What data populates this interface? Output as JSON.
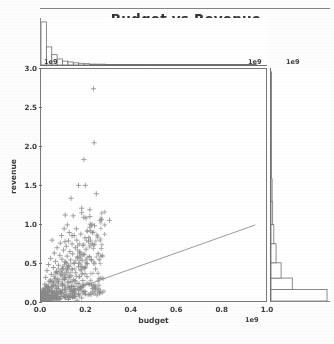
{
  "figure": {
    "title": "Budget vs Revenue",
    "background_color": "#ffffff",
    "marker_color": "#8a8a8a",
    "line_color": "#9a9a9a",
    "axis_color": "#6f6f6f"
  },
  "axes": {
    "xlabel": "budget",
    "ylabel": "revenue",
    "x_offset_text": "1e9",
    "y_offset_text": "1e9",
    "top_marginal_offset_text": "1e9",
    "right_marginal_offset_text": "1e9",
    "xticks": [
      "0.0",
      "0.2",
      "0.4",
      "0.6",
      "0.8",
      "1.0"
    ],
    "yticks": [
      "0.0",
      "0.5",
      "1.0",
      "1.5",
      "2.0",
      "2.5",
      "3.0"
    ]
  },
  "chart_data": {
    "type": "scatter",
    "title": "Budget vs Revenue",
    "xlabel": "budget",
    "ylabel": "revenue",
    "xlim": [
      0,
      1.05
    ],
    "ylim": [
      0,
      3.05
    ],
    "x_scale_offset": "1e9",
    "y_scale_offset": "1e9",
    "grid": false,
    "legend": null,
    "marker": "+",
    "marker_color": "#8a8a8a",
    "reference_line": {
      "label": "y = x",
      "color": "#9a9a9a",
      "x": [
        0.0,
        1.0
      ],
      "y": [
        0.0,
        1.0
      ]
    },
    "points": [
      [
        0.245,
        2.79
      ],
      [
        0.248,
        2.08
      ],
      [
        0.2,
        1.86
      ],
      [
        0.175,
        1.52
      ],
      [
        0.207,
        1.52
      ],
      [
        0.258,
        1.41
      ],
      [
        0.14,
        1.35
      ],
      [
        0.19,
        1.22
      ],
      [
        0.228,
        1.2
      ],
      [
        0.19,
        1.16
      ],
      [
        0.228,
        1.11
      ],
      [
        0.2,
        1.1
      ],
      [
        0.21,
        1.09
      ],
      [
        0.113,
        1.13
      ],
      [
        0.15,
        1.12
      ],
      [
        0.32,
        1.06
      ],
      [
        0.25,
        0.99
      ],
      [
        0.228,
        0.97
      ],
      [
        0.123,
        1.0
      ],
      [
        0.108,
        0.95
      ],
      [
        0.165,
        0.95
      ],
      [
        0.232,
        0.92
      ],
      [
        0.24,
        0.9
      ],
      [
        0.186,
        0.88
      ],
      [
        0.145,
        0.86
      ],
      [
        0.096,
        0.86
      ],
      [
        0.052,
        0.8
      ],
      [
        0.205,
        0.83
      ],
      [
        0.167,
        0.8
      ],
      [
        0.128,
        0.79
      ],
      [
        0.222,
        0.78
      ],
      [
        0.09,
        0.76
      ],
      [
        0.145,
        0.75
      ],
      [
        0.196,
        0.73
      ],
      [
        0.118,
        0.72
      ],
      [
        0.075,
        0.7
      ],
      [
        0.16,
        0.7
      ],
      [
        0.21,
        0.68
      ],
      [
        0.105,
        0.67
      ],
      [
        0.135,
        0.65
      ],
      [
        0.182,
        0.64
      ],
      [
        0.062,
        0.63
      ],
      [
        0.148,
        0.62
      ],
      [
        0.2,
        0.61
      ],
      [
        0.088,
        0.6
      ],
      [
        0.122,
        0.59
      ],
      [
        0.17,
        0.58
      ],
      [
        0.045,
        0.56
      ],
      [
        0.098,
        0.55
      ],
      [
        0.138,
        0.54
      ],
      [
        0.192,
        0.53
      ],
      [
        0.068,
        0.52
      ],
      [
        0.112,
        0.51
      ],
      [
        0.155,
        0.5
      ],
      [
        0.215,
        0.49
      ],
      [
        0.035,
        0.48
      ],
      [
        0.082,
        0.47
      ],
      [
        0.128,
        0.46
      ],
      [
        0.175,
        0.45
      ],
      [
        0.058,
        0.44
      ],
      [
        0.102,
        0.43
      ],
      [
        0.145,
        0.42
      ],
      [
        0.188,
        0.41
      ],
      [
        0.028,
        0.4
      ],
      [
        0.072,
        0.39
      ],
      [
        0.118,
        0.38
      ],
      [
        0.162,
        0.37
      ],
      [
        0.205,
        0.36
      ],
      [
        0.048,
        0.35
      ],
      [
        0.092,
        0.34
      ],
      [
        0.135,
        0.33
      ],
      [
        0.178,
        0.32
      ],
      [
        0.022,
        0.31
      ],
      [
        0.065,
        0.3
      ],
      [
        0.108,
        0.29
      ],
      [
        0.152,
        0.28
      ],
      [
        0.195,
        0.27
      ],
      [
        0.038,
        0.26
      ],
      [
        0.082,
        0.25
      ],
      [
        0.125,
        0.24
      ],
      [
        0.168,
        0.23
      ],
      [
        0.018,
        0.22
      ],
      [
        0.058,
        0.21
      ],
      [
        0.1,
        0.2
      ],
      [
        0.142,
        0.19
      ],
      [
        0.185,
        0.18
      ],
      [
        0.032,
        0.17
      ],
      [
        0.075,
        0.16
      ],
      [
        0.115,
        0.15
      ],
      [
        0.158,
        0.14
      ],
      [
        0.012,
        0.13
      ],
      [
        0.052,
        0.12
      ],
      [
        0.095,
        0.11
      ],
      [
        0.135,
        0.1
      ],
      [
        0.175,
        0.09
      ],
      [
        0.026,
        0.08
      ],
      [
        0.068,
        0.07
      ],
      [
        0.108,
        0.06
      ],
      [
        0.148,
        0.05
      ],
      [
        0.19,
        0.04
      ],
      [
        0.008,
        0.03
      ],
      [
        0.045,
        0.03
      ],
      [
        0.088,
        0.02
      ],
      [
        0.128,
        0.02
      ],
      [
        0.168,
        0.01
      ],
      [
        0.215,
        0.32
      ],
      [
        0.205,
        0.44
      ],
      [
        0.225,
        0.22
      ],
      [
        0.24,
        0.12
      ],
      [
        0.262,
        0.08
      ],
      [
        0.18,
        0.62
      ],
      [
        0.155,
        0.86
      ],
      [
        0.132,
        0.9
      ],
      [
        0.112,
        0.78
      ],
      [
        0.23,
        1.01
      ],
      [
        0.255,
        0.42
      ]
    ],
    "top_marginal": {
      "type": "histogram",
      "orientation": "vertical",
      "bin_edges": [
        0.0,
        0.025,
        0.05,
        0.075,
        0.1,
        0.125,
        0.15,
        0.175,
        0.2,
        0.225,
        0.25,
        0.3,
        0.35,
        0.4,
        0.5,
        0.6,
        0.8,
        1.0
      ],
      "counts": [
        100,
        42,
        24,
        14,
        9,
        7,
        5,
        4,
        3,
        2,
        2,
        1,
        1,
        1,
        1,
        1,
        1
      ]
    },
    "right_marginal": {
      "type": "histogram",
      "orientation": "horizontal",
      "bin_edges": [
        0.0,
        0.15,
        0.3,
        0.5,
        0.75,
        1.0,
        1.3,
        1.6,
        2.0,
        2.5,
        3.0
      ],
      "counts": [
        100,
        38,
        18,
        9,
        5,
        3,
        2,
        1,
        1,
        1
      ]
    }
  }
}
